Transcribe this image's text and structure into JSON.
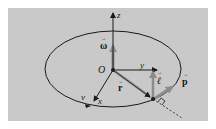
{
  "figure": {
    "background": "#c9c9c9",
    "colors": {
      "line": "#1a1a1a",
      "vector": "#8c8c8c"
    },
    "labels": {
      "z_axis": "z",
      "y_axis": "y",
      "x_axis": "x",
      "origin": "O",
      "omega": "ω",
      "r": "r",
      "ell": "ℓ",
      "p": "p",
      "v": "v"
    },
    "vector_arrow_mark": "→"
  }
}
